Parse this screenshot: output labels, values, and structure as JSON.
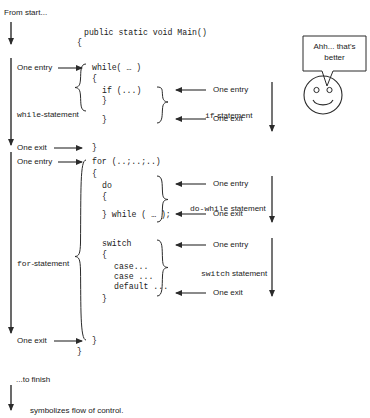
{
  "diagram": {
    "colors": {
      "ink": "#2b2b2b",
      "background": "#ffffff"
    },
    "flow_labels": {
      "from_start": "From start...",
      "to_finish": "...to finish",
      "legend": "symbolizes flow of control."
    },
    "left_annotations": [
      {
        "id": "while-one-entry",
        "text": "One entry"
      },
      {
        "id": "while-statement",
        "text": "while-statement",
        "mono_prefix": "while",
        "suffix": "-statement"
      },
      {
        "id": "while-one-exit",
        "text": "One exit"
      },
      {
        "id": "for-one-entry",
        "text": "One entry"
      },
      {
        "id": "for-statement",
        "text": "for-statement",
        "mono_prefix": "for",
        "suffix": "-statement"
      },
      {
        "id": "for-one-exit",
        "text": "One exit"
      }
    ],
    "right_annotations": [
      {
        "id": "if-one-entry",
        "text": "One entry"
      },
      {
        "id": "if-statement",
        "mono_prefix": "if",
        "suffix": "-statement"
      },
      {
        "id": "if-one-exit",
        "text": "One exit"
      },
      {
        "id": "dowhile-one-entry",
        "text": "One entry"
      },
      {
        "id": "dowhile-statement",
        "mono_prefix": "do-while",
        "suffix": " statement"
      },
      {
        "id": "dowhile-one-exit",
        "text": "One exit"
      },
      {
        "id": "switch-one-entry",
        "text": "One entry"
      },
      {
        "id": "switch-statement",
        "mono_prefix": "switch",
        "suffix": " statement"
      },
      {
        "id": "switch-one-exit",
        "text": "One exit"
      }
    ],
    "code": {
      "method_signature": "public static void Main()",
      "method_open_brace": "{",
      "while_header": "while( … )",
      "while_open_brace": "{",
      "if_line": "if (...)",
      "if_close_brace": "}",
      "while_close_brace": "}",
      "while_block_close": "}",
      "for_header": "for (..;..;..)",
      "for_open_brace": "{",
      "do_keyword": "do",
      "do_open_brace": "{",
      "do_while_tail": "} while ( … );",
      "switch_keyword": "switch",
      "switch_open_brace": "{",
      "case_1": "case...",
      "case_2": "case ...",
      "default_line": "default ...",
      "switch_close_brace": "}",
      "for_close_brace": "}",
      "method_close_brace": "}"
    },
    "speech_bubble": {
      "line1": "Ahh... that's",
      "line2": "better"
    },
    "smiley": {
      "name": "smiley-face"
    }
  }
}
